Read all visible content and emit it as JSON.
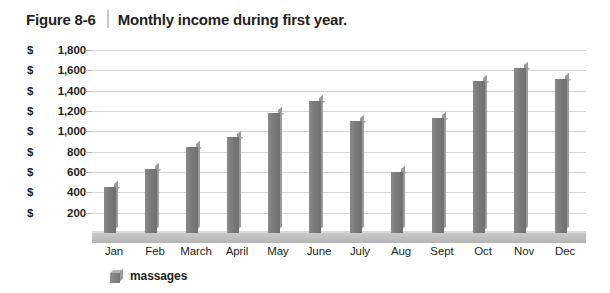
{
  "figure": {
    "label": "Figure 8-6",
    "title": "Monthly income during first year."
  },
  "legend": {
    "series_label": "massages",
    "swatch_name": "series-color-swatch"
  },
  "chart_data": {
    "type": "bar",
    "title": "Monthly income during first year.",
    "xlabel": "",
    "ylabel": "",
    "categories": [
      "Jan",
      "Feb",
      "March",
      "April",
      "May",
      "June",
      "July",
      "Aug",
      "Sept",
      "Oct",
      "Nov",
      "Dec"
    ],
    "series": [
      {
        "name": "massages",
        "values": [
          450,
          630,
          850,
          940,
          1180,
          1300,
          1100,
          600,
          1130,
          1500,
          1620,
          1510
        ]
      }
    ],
    "ytick_labels": [
      "$1,800",
      "$1,600",
      "$1,400",
      "$1,200",
      "$1,000",
      "$   800",
      "$   600",
      "$   400",
      "$   200"
    ],
    "ytick_values": [
      1800,
      1600,
      1400,
      1200,
      1000,
      800,
      600,
      400,
      200
    ],
    "ylim": [
      0,
      1800
    ],
    "grid": true,
    "legend_position": "bottom-left",
    "bar_color": "#7c7c7c",
    "grid_color": "#d6d6d6"
  }
}
